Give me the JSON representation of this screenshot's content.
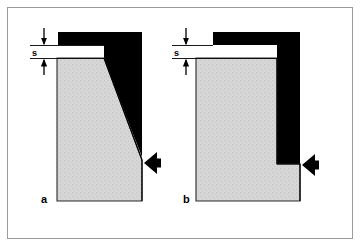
{
  "figure": {
    "kind": "technical-line-diagram",
    "background_color": "#ffffff",
    "frame": {
      "border_color": "#9a9a9a",
      "border_width_px": 1,
      "x": 7,
      "y": 7,
      "width": 346,
      "height": 232
    },
    "colors": {
      "tool_black": "#000000",
      "workpiece_gray": "#d4d4d4",
      "workpiece_gray_dots": "#c2c2c2",
      "outline": "#000000",
      "frame_gray": "#9a9a9a",
      "white": "#ffffff"
    },
    "panels": [
      {
        "id": "a",
        "label": "a",
        "label_x": 45,
        "label_y": 203,
        "dimension": {
          "label": "s",
          "label_x": 36,
          "label_y": 53,
          "meaning": "clearance gap",
          "line_y_top": 45,
          "line_y_bottom": 58,
          "extension_x_start": 30,
          "extension_x_end": 62,
          "witness_x": 44,
          "witness_y_top": 28,
          "witness_y_bottom": 74
        },
        "arrow": {
          "direction": "left",
          "tip_x": 143,
          "tip_y": 163,
          "width": 17,
          "height": 22
        },
        "shapes": {
          "tool_black_note": "upper punch/die block with angled shear face",
          "workpiece_gray_note": "sheet section with inclined cut edge"
        }
      },
      {
        "id": "b",
        "label": "b",
        "label_x": 187,
        "label_y": 203,
        "dimension": {
          "label": "s",
          "label_x": 178,
          "label_y": 53,
          "meaning": "clearance gap",
          "line_y_top": 45,
          "line_y_bottom": 58,
          "extension_x_start": 172,
          "extension_x_end": 205,
          "witness_x": 186,
          "witness_y_top": 28,
          "witness_y_bottom": 74
        },
        "arrow": {
          "direction": "left",
          "tip_x": 300,
          "tip_y": 165,
          "width": 17,
          "height": 22
        },
        "shapes": {
          "tool_black_note": "inverted-L punch/die block with straight vertical face",
          "workpiece_gray_note": "sheet section with stepped square cut edge"
        }
      }
    ]
  }
}
